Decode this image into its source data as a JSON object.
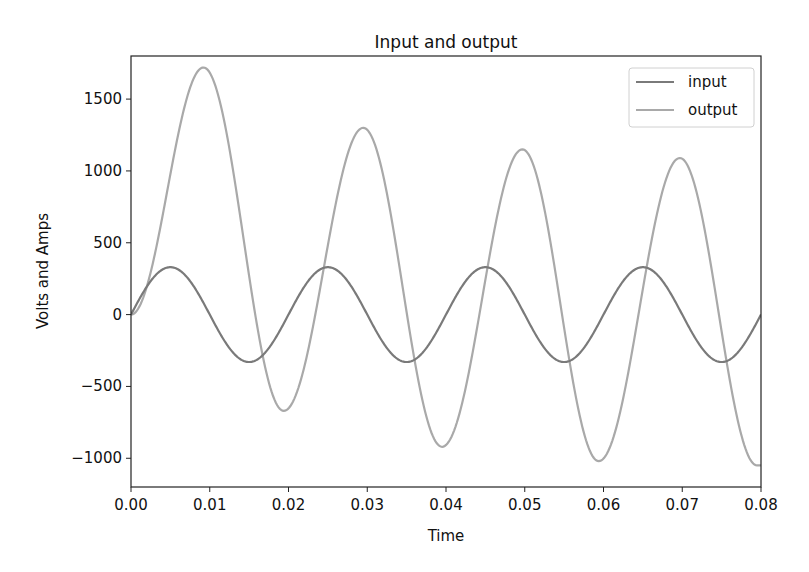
{
  "chart_data": {
    "type": "line",
    "title": "Input and output",
    "xlabel": "Time",
    "ylabel": "Volts and Amps",
    "xlim": [
      0.0,
      0.08
    ],
    "ylim": [
      -1200,
      1800
    ],
    "grid": false,
    "legend_position": "upper right",
    "x_ticks": [
      "0.00",
      "0.01",
      "0.02",
      "0.03",
      "0.04",
      "0.05",
      "0.06",
      "0.07",
      "0.08"
    ],
    "y_ticks": [
      "−1000",
      "−500",
      "0",
      "500",
      "1000",
      "1500"
    ],
    "y_tick_values": [
      -1000,
      -500,
      0,
      500,
      1000,
      1500
    ],
    "x_tick_values": [
      0.0,
      0.01,
      0.02,
      0.03,
      0.04,
      0.05,
      0.06,
      0.07,
      0.08
    ],
    "series": [
      {
        "name": "input",
        "color": "#7a7a7a",
        "description": "sinusoid, amplitude ~330, period 0.02 s",
        "amplitude": 330,
        "period": 0.02,
        "x": [
          0.0,
          0.005,
          0.01,
          0.015,
          0.02,
          0.025,
          0.03,
          0.035,
          0.04,
          0.045,
          0.05,
          0.055,
          0.06,
          0.065,
          0.07,
          0.075,
          0.08
        ],
        "values": [
          0,
          330,
          0,
          -330,
          0,
          330,
          0,
          -330,
          0,
          330,
          0,
          -330,
          0,
          330,
          0,
          -330,
          0
        ]
      },
      {
        "name": "output",
        "color": "#a9a9a9",
        "description": "damped response oscillating with growing negative offset",
        "x": [
          0.0,
          0.0092,
          0.0194,
          0.0295,
          0.0395,
          0.0497,
          0.0594,
          0.0697,
          0.0795,
          0.08
        ],
        "values": [
          0,
          1720,
          -670,
          1300,
          -920,
          1150,
          -1020,
          1090,
          -1050,
          -1050
        ]
      }
    ]
  }
}
